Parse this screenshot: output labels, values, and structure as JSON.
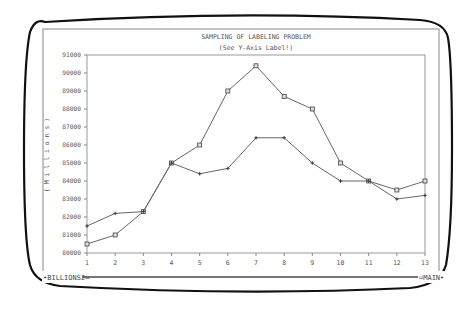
{
  "window": {
    "status_left": "BILLIONS2",
    "status_right": "MAIN"
  },
  "chart_data": {
    "type": "line",
    "title": "SAMPLING OF LABELING PROBLEM",
    "subtitle": "(See Y-Axis Label!)",
    "xlabel": "",
    "ylabel": "(Millions)",
    "x": [
      1,
      2,
      3,
      4,
      5,
      6,
      7,
      8,
      9,
      10,
      11,
      12,
      13
    ],
    "ylim": [
      80000,
      91000
    ],
    "yticks": [
      80000,
      81000,
      82000,
      83000,
      84000,
      85000,
      86000,
      87000,
      88000,
      89000,
      90000,
      91000
    ],
    "grid": false,
    "legend": null,
    "series": [
      {
        "name": "Series 1",
        "marker": "square",
        "values": [
          80500,
          81000,
          82300,
          85000,
          86000,
          89000,
          90400,
          88700,
          88000,
          85000,
          84000,
          83500,
          84000
        ]
      },
      {
        "name": "Series 2",
        "marker": "cross",
        "values": [
          81500,
          82200,
          82300,
          85000,
          84400,
          84700,
          86400,
          86400,
          85000,
          84000,
          84000,
          83000,
          83200
        ]
      }
    ]
  }
}
